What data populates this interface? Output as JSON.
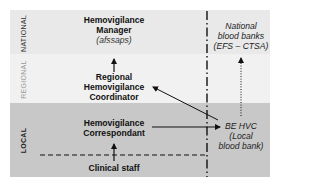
{
  "diagram": {
    "colors": {
      "national_band": "#e9e9e9",
      "regional_band": "#f1f1f1",
      "local_band": "#c8c8c8",
      "line": "#111111",
      "national_label": "#333333",
      "regional_label": "#9a9a9a",
      "local_label": "#222222"
    },
    "levels": [
      {
        "id": "national",
        "label": "NATIONAL"
      },
      {
        "id": "regional",
        "label": "REGIONAL"
      },
      {
        "id": "local",
        "label": "LOCAL"
      }
    ],
    "nodes": {
      "manager": {
        "title_lines": [
          "Hemovigilance",
          "Manager"
        ],
        "subtitle": "(afssaps)"
      },
      "coordinator": {
        "title_lines": [
          "Regional",
          "Hemovigilance",
          "Coordinator"
        ]
      },
      "correspondant": {
        "title_lines": [
          "Hemovigilance",
          "Correspondant"
        ]
      },
      "clinical_staff": {
        "title_lines": [
          "Clinical staff"
        ]
      },
      "national_blood_banks": {
        "italic_lines": [
          "National",
          "blood banks",
          "(EFS – CTSA)"
        ]
      },
      "be_hvc": {
        "italic_lines": [
          "BE HVC",
          "(Local",
          "blood bank)"
        ]
      }
    },
    "connectors": [
      {
        "from": "coordinator",
        "to": "manager",
        "style": "solid",
        "direction": "up"
      },
      {
        "from": "clinical_staff",
        "to": "correspondant",
        "style": "solid",
        "direction": "up"
      },
      {
        "from": "correspondant",
        "to": "be_hvc",
        "style": "solid",
        "direction": "right"
      },
      {
        "from": "be_hvc",
        "to": "coordinator",
        "style": "solid",
        "direction": "diagonal-up-left"
      },
      {
        "from": "be_hvc",
        "to": "national_blood_banks",
        "style": "dotted",
        "direction": "up"
      }
    ],
    "separators": [
      {
        "type": "dash-dot-vertical",
        "between": "institutional-vs-blood-bank"
      },
      {
        "type": "dashed-horizontal",
        "between": "correspondant-vs-clinical-staff"
      }
    ]
  }
}
